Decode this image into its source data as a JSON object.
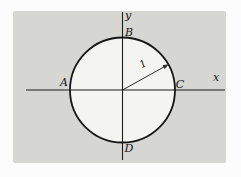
{
  "figure": {
    "labels": {
      "x_axis": "x",
      "y_axis": "y",
      "point_left": "A",
      "point_top": "B",
      "point_right": "C",
      "point_bottom": "D",
      "radius": "1"
    },
    "colors": {
      "panel": "#d6d6d3",
      "circle_fill": "#f4f4f1",
      "line": "#1d1d1d",
      "page": "#fcfcfc"
    }
  }
}
